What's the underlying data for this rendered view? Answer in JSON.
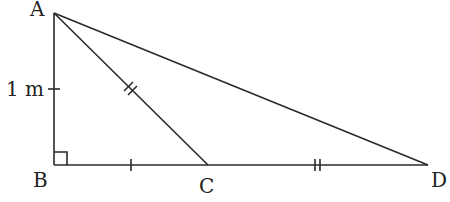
{
  "diagram": {
    "type": "geometry-triangle",
    "points": {
      "A": {
        "label": "A",
        "x": 54,
        "y": 13
      },
      "B": {
        "label": "B",
        "x": 54,
        "y": 165
      },
      "C": {
        "label": "C",
        "x": 208,
        "y": 165
      },
      "D": {
        "label": "D",
        "x": 428,
        "y": 165
      }
    },
    "segments": [
      "AB",
      "BD",
      "AC",
      "AD"
    ],
    "right_angle_at": "B",
    "annotations": {
      "ab_length": "1 m",
      "bc_marks": "single tick",
      "ac_marks": "double tick",
      "cd_marks": "double tick"
    },
    "color": "#2a2a2a"
  }
}
